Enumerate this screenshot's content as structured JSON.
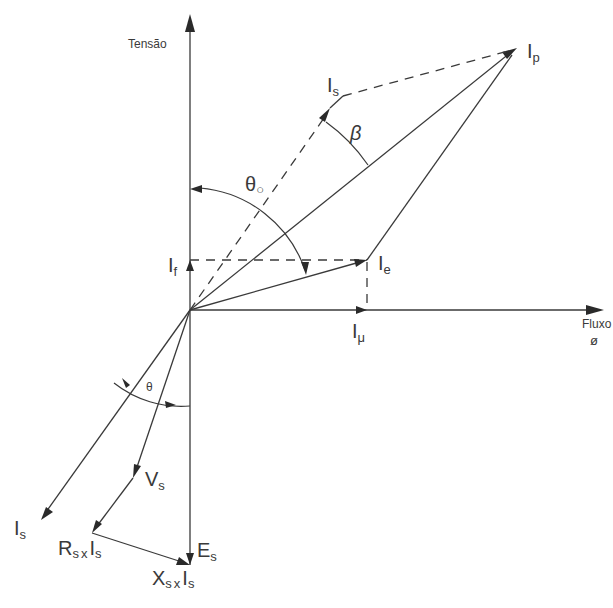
{
  "axes": {
    "vertical_label": "Tensão",
    "horizontal_label": "Fluxo",
    "horizontal_symbol": "ø"
  },
  "phasors": {
    "Ip": {
      "main": "I",
      "sub": "p"
    },
    "Is_upper": {
      "main": "I",
      "sub": "s"
    },
    "If": {
      "main": "I",
      "sub": "f"
    },
    "Ie": {
      "main": "I",
      "sub": "e"
    },
    "Imu": {
      "main": "I",
      "sub": "μ"
    },
    "Vs": {
      "main": "V",
      "sub": "s"
    },
    "Is_lower": {
      "main": "I",
      "sub": "s"
    },
    "Es": {
      "main": "E",
      "sub": "s"
    },
    "RsIs": {
      "main1": "R",
      "sub1": "s",
      "x": "x",
      "main2": "I",
      "sub2": "s"
    },
    "XsIs": {
      "main1": "X",
      "sub1": "s",
      "x": "x",
      "main2": "I",
      "sub2": "s"
    }
  },
  "angles": {
    "beta": "β",
    "theta0": {
      "main": "θ",
      "sub": "○"
    },
    "theta": "θ"
  }
}
